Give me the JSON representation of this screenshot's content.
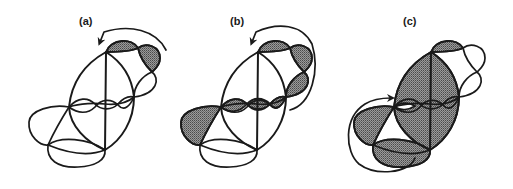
{
  "figure": {
    "panels": [
      {
        "id": "a",
        "label": "(a)",
        "shaded_regions": [
          "top-left-lobe",
          "top-right-lobe"
        ],
        "arrow_direction": "counterclockwise-top"
      },
      {
        "id": "b",
        "label": "(b)",
        "shaded_regions": [
          "top-left-lobe",
          "top-right-lobe",
          "right-lobe-lower",
          "middle-chain-lobes",
          "left-lobe"
        ],
        "arrow_direction": "counterclockwise-right"
      },
      {
        "id": "c",
        "label": "(c)",
        "shaded_regions": [
          "top-left-lobe",
          "central-body",
          "left-lobe",
          "bottom-lobe"
        ],
        "arrow_direction": "counterclockwise-bottom-left"
      }
    ],
    "colors": {
      "stroke": "#1a1a1a",
      "shade": "#808080",
      "background": "#ffffff"
    }
  }
}
